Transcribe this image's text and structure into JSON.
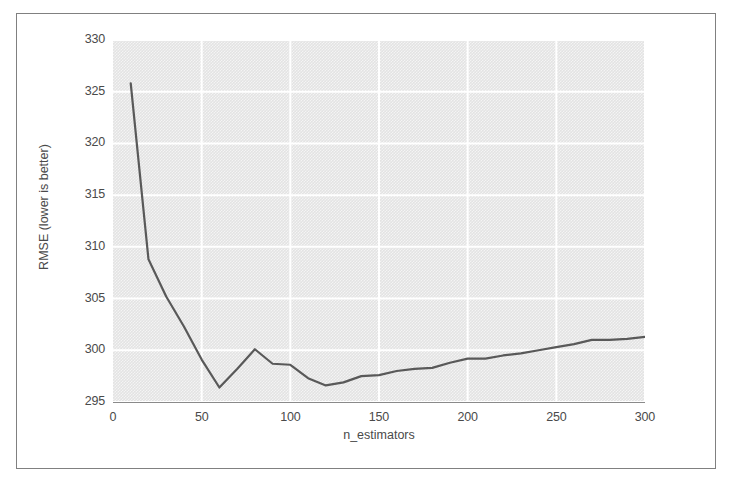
{
  "figure": {
    "background_color": "#ffffff",
    "frame_color": "#808080",
    "plot_background_color": "#e3e3e3",
    "grid_color": "#ffffff",
    "line_color": "#595959",
    "tick_label_color": "#4a4a4a"
  },
  "chart_data": {
    "type": "line",
    "title": "",
    "xlabel": "n_estimators",
    "ylabel": "RMSE (lower is better)",
    "xlim": [
      0,
      300
    ],
    "ylim": [
      295,
      330
    ],
    "xticks": [
      0,
      50,
      100,
      150,
      200,
      250,
      300
    ],
    "yticks": [
      295,
      300,
      305,
      310,
      315,
      320,
      325,
      330
    ],
    "xtick_labels": [
      "0",
      "50",
      "100",
      "150",
      "200",
      "250",
      "300"
    ],
    "ytick_labels": [
      "295",
      "300",
      "305",
      "310",
      "315",
      "320",
      "325",
      "330"
    ],
    "grid": true,
    "grid_axis": "both",
    "legend": false,
    "series": [
      {
        "name": "RMSE",
        "color": "#595959",
        "linewidth": 2.2,
        "x": [
          10,
          20,
          30,
          40,
          50,
          60,
          70,
          80,
          90,
          100,
          110,
          120,
          130,
          140,
          150,
          160,
          170,
          180,
          190,
          200,
          210,
          220,
          230,
          240,
          250,
          260,
          270,
          280,
          290,
          300
        ],
        "y": [
          325.8,
          308.8,
          305.2,
          302.3,
          299.1,
          296.4,
          298.2,
          300.1,
          298.7,
          298.6,
          297.3,
          296.6,
          296.9,
          297.5,
          297.6,
          298.0,
          298.2,
          298.3,
          298.8,
          299.2,
          299.2,
          299.5,
          299.7,
          300.0,
          300.3,
          300.6,
          301.0,
          301.0,
          301.1,
          301.3
        ]
      }
    ]
  }
}
